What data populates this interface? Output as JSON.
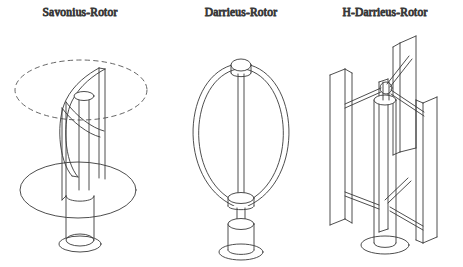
{
  "figure": {
    "background_color": "#ffffff",
    "line_color": "#3a3a3a",
    "dash_color": "#555555",
    "text_color": "#2b2b2b",
    "width": 463,
    "height": 267
  },
  "panels": [
    {
      "id": "savonius",
      "title": "Savonius-Rotor",
      "title_x": 80,
      "title_y": 16,
      "parts": {
        "swept_circle": "dashed-ellipse",
        "rotor": "s-shaped-curved-blades",
        "shaft": "central-vertical-shaft",
        "base_disc": "large-elliptical-platform",
        "pedestal": "cylindrical-pedestal",
        "foot": "elliptical-foot-ring"
      }
    },
    {
      "id": "darrieus",
      "title": "Darrieus-Rotor",
      "title_x": 241,
      "title_y": 16,
      "parts": {
        "blades": "two-curved-troposkein-blades",
        "top_cap": "top-hub-cylinder",
        "mast": "central-vertical-mast",
        "lower_hub": "lower-hub-collar",
        "pedestal": "cylindrical-pedestal",
        "foot": "elliptical-foot-ring"
      }
    },
    {
      "id": "h-darrieus",
      "title": "H-Darrieus-Rotor",
      "title_x": 385,
      "title_y": 16,
      "parts": {
        "blades": "three-straight-vertical-blades",
        "arms": "horizontal-support-arms",
        "hub": "central-hub-sphere",
        "tower": "cylindrical-tower",
        "foot": "elliptical-base-plate"
      }
    }
  ]
}
